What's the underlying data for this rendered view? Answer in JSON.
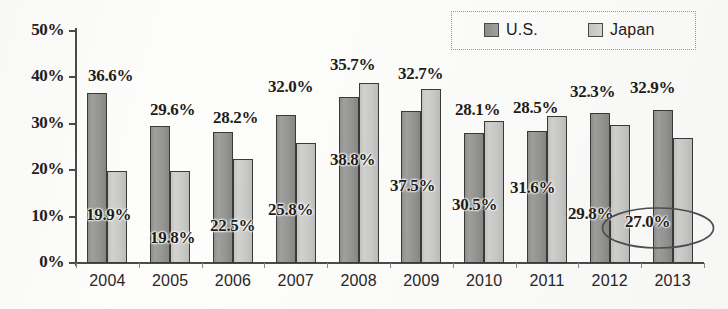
{
  "chart_data": {
    "type": "bar",
    "title": "",
    "xlabel": "",
    "ylabel": "",
    "ylim": [
      0,
      50
    ],
    "ytick_labels": [
      "0%",
      "10%",
      "20%",
      "30%",
      "40%",
      "50%"
    ],
    "ytick_values": [
      0,
      10,
      20,
      30,
      40,
      50
    ],
    "grid": false,
    "legend_position": "top-right",
    "categories": [
      "2004",
      "2005",
      "2006",
      "2007",
      "2008",
      "2009",
      "2010",
      "2011",
      "2012",
      "2013"
    ],
    "series": [
      {
        "name": "U.S.",
        "color": "#949492",
        "values": [
          36.6,
          29.6,
          28.2,
          32.0,
          35.7,
          32.7,
          28.1,
          28.5,
          32.3,
          32.9
        ],
        "data_labels": [
          "36.6%",
          "29.6%",
          "28.2%",
          "32.0%",
          "35.7%",
          "32.7%",
          "28.1%",
          "28.5%",
          "32.3%",
          "32.9%"
        ]
      },
      {
        "name": "Japan",
        "color": "#c9c9c7",
        "values": [
          19.9,
          19.8,
          22.5,
          25.8,
          38.8,
          37.5,
          30.5,
          31.6,
          29.8,
          27.0
        ],
        "data_labels": [
          "19.9%",
          "19.8%",
          "22.5%",
          "25.8%",
          "38.8%",
          "37.5%",
          "30.5%",
          "31.6%",
          "29.8%",
          "27.0%"
        ]
      }
    ],
    "annotations": [
      {
        "kind": "ellipse-highlight",
        "target_series": "Japan",
        "target_category": "2013",
        "text": "27.0%"
      }
    ]
  },
  "legend": {
    "items": [
      {
        "label": "U.S.",
        "swatch": "us"
      },
      {
        "label": "Japan",
        "swatch": "jp"
      }
    ]
  },
  "axis": {
    "y_labels": [
      "50%",
      "40%",
      "30%",
      "20%",
      "10%",
      "0%"
    ],
    "x_labels": [
      "2004",
      "2005",
      "2006",
      "2007",
      "2008",
      "2009",
      "2010",
      "2011",
      "2012",
      "2013"
    ]
  },
  "value_labels": {
    "us": [
      "36.6%",
      "29.6%",
      "28.2%",
      "32.0%",
      "35.7%",
      "32.7%",
      "28.1%",
      "28.5%",
      "32.3%",
      "32.9%"
    ],
    "jp": [
      "19.9%",
      "19.8%",
      "22.5%",
      "25.8%",
      "38.8%",
      "37.5%",
      "30.5%",
      "31.6%",
      "29.8%",
      "27.0%"
    ]
  }
}
